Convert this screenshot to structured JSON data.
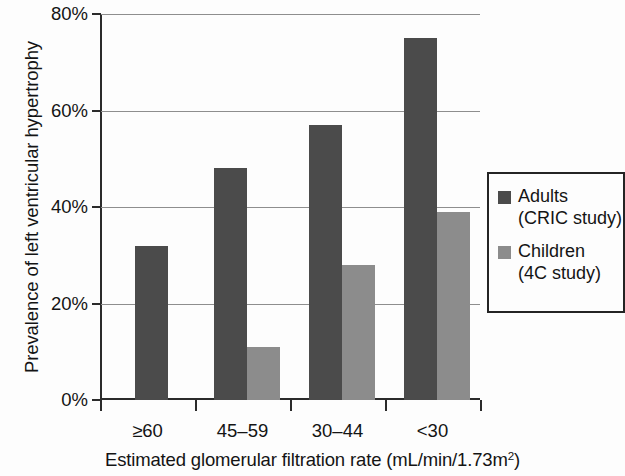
{
  "chart_data": {
    "type": "bar",
    "title": "",
    "xlabel": "Estimated glomerular filtration rate (mL/min/1.73m2)",
    "xlabel_main": "Estimated glomerular filtration rate (mL/min/1.73m",
    "xlabel_sup": "2",
    "xlabel_tail": ")",
    "ylabel": "Prevalence of left ventricular hypertrophy",
    "categories": [
      "≥60",
      "45–59",
      "30–44",
      "<30"
    ],
    "series": [
      {
        "name": "Adults",
        "sub": "(CRIC study)",
        "color": "#4b4b4b",
        "values": [
          32,
          48,
          57,
          75
        ]
      },
      {
        "name": "Children",
        "sub": "(4C study)",
        "color": "#8c8c8c",
        "values": [
          null,
          11,
          28,
          39
        ]
      }
    ],
    "ylim": [
      0,
      80
    ],
    "ytick_values": [
      0,
      20,
      40,
      60,
      80
    ],
    "ytick_labels": [
      "0%",
      "20%",
      "40%",
      "60%",
      "80%"
    ],
    "grid": true,
    "legend_position": "right",
    "legend_entries": [
      {
        "label": "Adults",
        "sublabel": "(CRIC study)",
        "swatch": "adults"
      },
      {
        "label": "Children",
        "sublabel": "(4C study)",
        "swatch": "children"
      }
    ]
  }
}
